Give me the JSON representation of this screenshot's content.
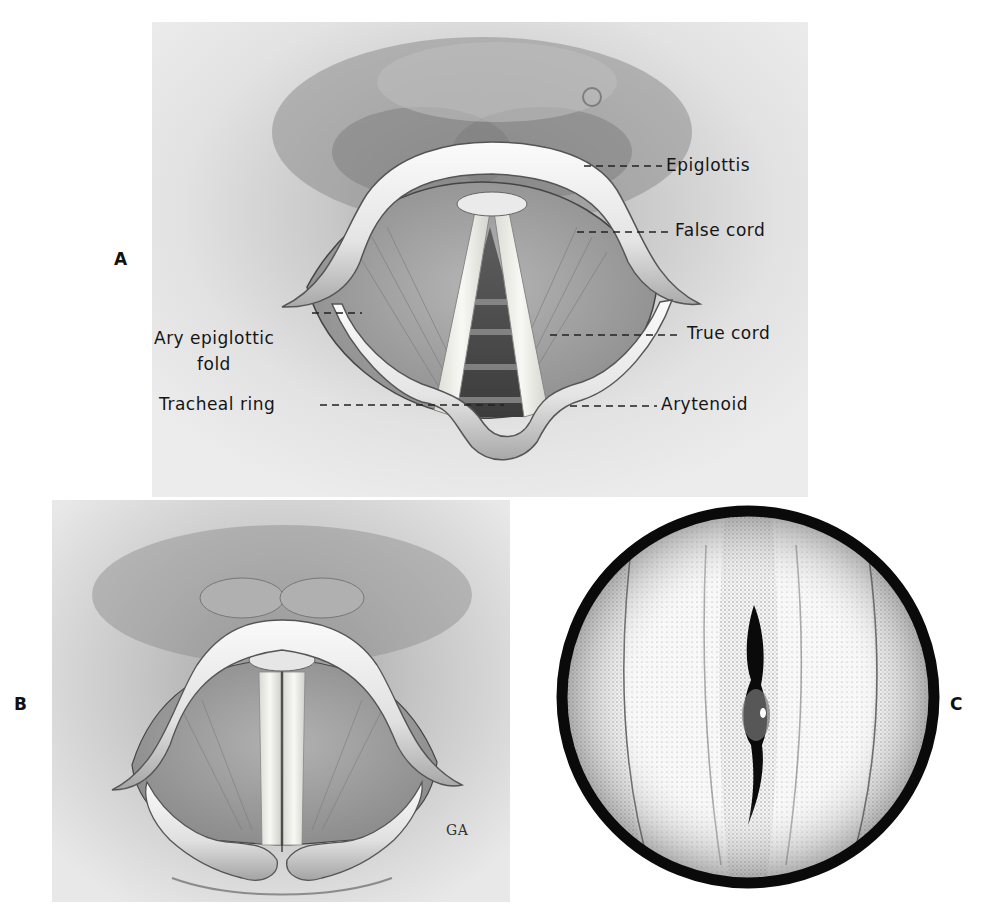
{
  "figure": {
    "panels": [
      {
        "id": "A",
        "label": "A",
        "annotations": [
          {
            "text": "Epiglottis"
          },
          {
            "text": "False cord"
          },
          {
            "text": "True cord"
          },
          {
            "text": "Arytenoid"
          },
          {
            "text": "Ary epiglottic",
            "text2": "fold"
          },
          {
            "text": "Tracheal ring"
          }
        ]
      },
      {
        "id": "B",
        "label": "B",
        "signature": "GA"
      },
      {
        "id": "C",
        "label": "C"
      }
    ],
    "colors": {
      "background": "#ffffff",
      "panel_bg": "#e6e6e6",
      "shadow": "#7a7a7a",
      "cartilage": "#f2f2f2",
      "cord": "#f6f6f2",
      "ink": "#111111"
    }
  }
}
